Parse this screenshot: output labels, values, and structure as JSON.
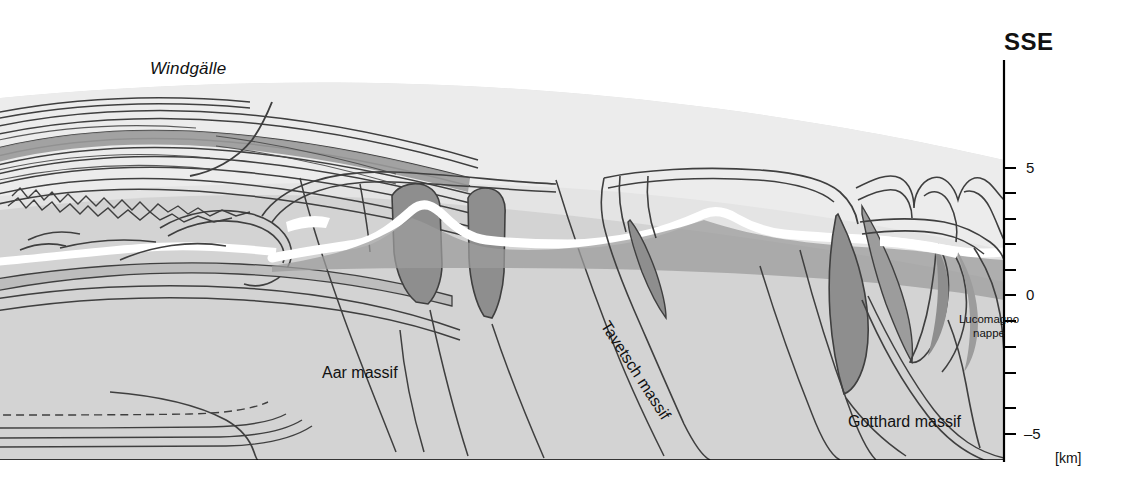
{
  "figure": {
    "type": "geological-cross-section",
    "orientation_label": "SSE",
    "depth_axis": {
      "unit": "[km]",
      "labels": [
        "5",
        "0",
        "–5"
      ],
      "values": [
        5,
        0,
        -5
      ],
      "tick_values": [
        5,
        4,
        3,
        2,
        1,
        0,
        -1,
        -2,
        -3,
        -4,
        -5
      ],
      "range": [
        -5.5,
        9.5
      ]
    },
    "labels": {
      "windgaelle": "Windgälle",
      "aar_massif": "Aar massif",
      "tavetsch_massif": "Tavetsch massif",
      "gotthard_massif": "Gotthard massif",
      "lucomagno_line1": "Lucomagno",
      "lucomagno_line2": "nappe"
    },
    "colors": {
      "background": "#ffffff",
      "above_surface": "#fdfdfd",
      "cover_light": "#e2e2e2",
      "basement_mid": "#d2d2d2",
      "unit_gray": "#c6c6c6",
      "unit_dark": "#8e8e8e",
      "marker_white": "#ffffff",
      "line": "#3c3c3c",
      "axis": "#000000",
      "text": "#111111"
    }
  }
}
